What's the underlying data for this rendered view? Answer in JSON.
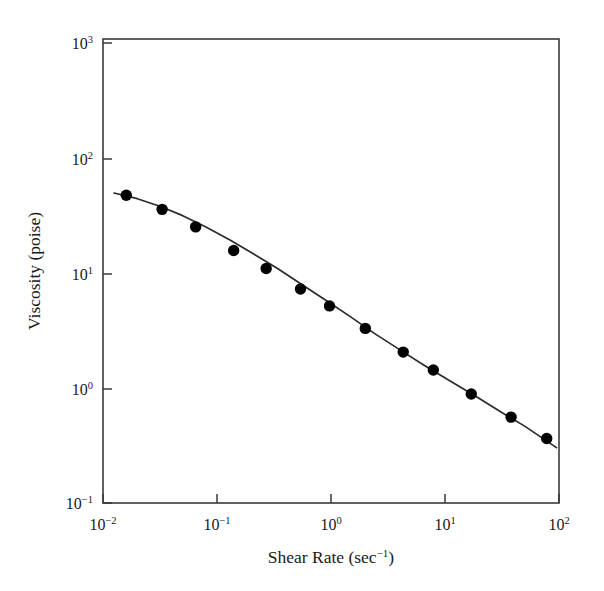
{
  "figure": {
    "background": "#ffffff",
    "frame_color": "#3a3a3a",
    "data_color": "#000000",
    "line_color": "#2b2b2b"
  },
  "axes": {
    "x": {
      "title_main": "Shear Rate (sec",
      "title_exp": "−1",
      "title_tail": ")",
      "title_full": "Shear Rate (sec⁻¹)",
      "ticks": [
        {
          "base": "10",
          "exp": "−2",
          "value": 0.01
        },
        {
          "base": "10",
          "exp": "−1",
          "value": 0.1
        },
        {
          "base": "10",
          "exp": "0",
          "value": 1
        },
        {
          "base": "10",
          "exp": "1",
          "value": 10
        },
        {
          "base": "10",
          "exp": "2",
          "value": 100
        }
      ]
    },
    "y": {
      "title_full": "Viscosity (poise)",
      "ticks": [
        {
          "base": "10",
          "exp": "3",
          "value": 1000
        },
        {
          "base": "10",
          "exp": "2",
          "value": 100
        },
        {
          "base": "10",
          "exp": "1",
          "value": 10
        },
        {
          "base": "10",
          "exp": "0",
          "value": 1
        },
        {
          "base": "10",
          "exp": "−1",
          "value": 0.1
        }
      ]
    }
  },
  "chart_data": {
    "type": "scatter",
    "title": "",
    "xlabel": "Shear Rate (sec⁻¹)",
    "ylabel": "Viscosity (poise)",
    "xscale": "log",
    "yscale": "log",
    "xlim": [
      0.01,
      100
    ],
    "ylim": [
      0.1,
      1000
    ],
    "grid": false,
    "legend": null,
    "series": [
      {
        "name": "measured viscosity",
        "marker": "filled-circle",
        "marker_size": 9,
        "x": [
          0.016,
          0.033,
          0.065,
          0.14,
          0.27,
          0.54,
          0.97,
          2.0,
          4.3,
          7.9,
          17.0,
          38.0,
          78.0
        ],
        "y": [
          45.0,
          34.0,
          24.0,
          15.0,
          10.5,
          7.0,
          5.0,
          3.2,
          2.0,
          1.4,
          0.87,
          0.55,
          0.36
        ]
      },
      {
        "name": "fitted curve",
        "style": "solid-line",
        "x": [
          0.0125,
          0.02,
          0.032,
          0.05,
          0.08,
          0.13,
          0.21,
          0.34,
          0.55,
          0.9,
          1.5,
          2.4,
          4.0,
          6.5,
          11.0,
          18.0,
          30.0,
          50.0,
          95.0
        ],
        "y": [
          47.0,
          42.0,
          36.0,
          30.0,
          24.0,
          18.5,
          14.0,
          10.5,
          7.7,
          5.6,
          4.0,
          2.9,
          2.1,
          1.55,
          1.13,
          0.85,
          0.62,
          0.46,
          0.3
        ]
      }
    ]
  }
}
